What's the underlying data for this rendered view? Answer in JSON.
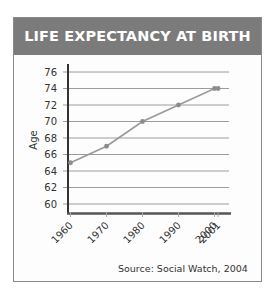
{
  "chart_data": {
    "type": "line",
    "title": "LIFE EXPECTANCY AT BIRTH",
    "xlabel": "",
    "ylabel": "Age",
    "x": [
      1960,
      1970,
      1980,
      1990,
      2000,
      2001
    ],
    "categories": [
      "1960",
      "1970",
      "1980",
      "1990",
      "2000",
      "2001"
    ],
    "series": [
      {
        "name": "Life expectancy at birth",
        "values": [
          65,
          67,
          70,
          72,
          74,
          74
        ]
      }
    ],
    "yticks": [
      60,
      62,
      64,
      66,
      68,
      70,
      72,
      74,
      76
    ],
    "ylim": [
      59,
      76
    ],
    "xlim": [
      1960,
      2003
    ],
    "grid": true,
    "legend": "none",
    "annotations": [
      "Source: Social Watch, 2004"
    ],
    "colors": {
      "line": "#999999",
      "marker": "#888888",
      "grid": "#999999",
      "axis": "#333333",
      "header_bg": "#7b7b7b"
    }
  },
  "header": {
    "title": "LIFE EXPECTANCY AT BIRTH"
  },
  "axis": {
    "ylabel": "Age",
    "ytick_labels": [
      "76",
      "74",
      "72",
      "70",
      "68",
      "66",
      "64",
      "62",
      "60"
    ],
    "xtick_labels": [
      "1960",
      "1970",
      "1980",
      "1990",
      "2000",
      "2001"
    ]
  },
  "source": "Source: Social Watch, 2004"
}
